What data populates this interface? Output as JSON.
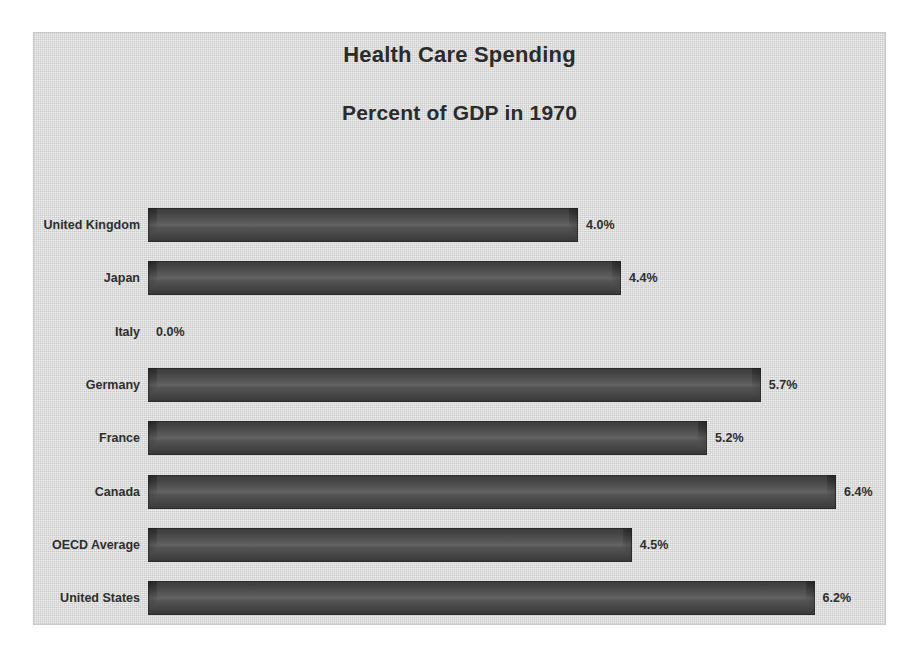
{
  "chart_data": {
    "type": "bar",
    "orientation": "horizontal",
    "title": "Health Care Spending",
    "subtitle": "Percent of GDP in 1970",
    "xlabel": "",
    "ylabel": "",
    "grid": false,
    "legend": "none",
    "axis_visible": false,
    "value_suffix": "%",
    "xlim": [
      0,
      6.9
    ],
    "categories": [
      "United Kingdom",
      "Japan",
      "Italy",
      "Germany",
      "France",
      "Canada",
      "OECD Average",
      "United States"
    ],
    "values": [
      4.0,
      4.4,
      0.0,
      5.7,
      5.2,
      6.4,
      4.5,
      6.2
    ],
    "data_labels": [
      "4.0%",
      "4.4%",
      "0.0%",
      "5.7%",
      "5.2%",
      "6.4%",
      "4.5%",
      "6.2%"
    ],
    "colors": {
      "plot_background": "#d4d4d4",
      "page_background": "#ffffff",
      "bar_fill": "#4a4a4a",
      "bar_highlight": "#646464",
      "bar_shadow": "#383838",
      "text": "#2e2e2e",
      "title_text": "#2b2b2b"
    }
  }
}
